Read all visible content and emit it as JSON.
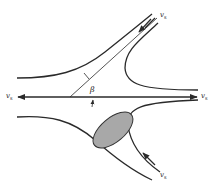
{
  "diagram": {
    "type": "flow-streamline-diagram",
    "colors": {
      "line": "#2a2a2a",
      "ellipse_fill": "#a8a8a8",
      "ellipse_stroke": "#333333",
      "background": "#ffffff"
    },
    "labels": {
      "top_right_velocity": {
        "symbol": "v",
        "subscript": "s"
      },
      "left_velocity": {
        "symbol": "v",
        "subscript": "s"
      },
      "right_velocity": {
        "symbol": "v",
        "subscript": "s"
      },
      "bottom_right_velocity": {
        "symbol": "v",
        "subscript": "s"
      },
      "angle": "β"
    },
    "nodes": [
      {
        "id": "upper-left-streamline",
        "label": ""
      },
      {
        "id": "upper-right-streamline",
        "label": ""
      },
      {
        "id": "lower-left-streamline",
        "label": ""
      },
      {
        "id": "lower-right-streamline",
        "label": ""
      },
      {
        "id": "horizontal-axis",
        "label": ""
      },
      {
        "id": "inclined-line",
        "label": ""
      },
      {
        "id": "shaded-ellipse",
        "label": ""
      }
    ],
    "edges": [
      {
        "from": "top-right-inflow",
        "to": "center",
        "direction": "inward"
      },
      {
        "from": "bottom-right-inflow",
        "to": "center",
        "direction": "inward"
      },
      {
        "from": "center",
        "to": "left",
        "direction": "outward"
      },
      {
        "from": "center",
        "to": "right",
        "direction": "outward"
      }
    ]
  }
}
